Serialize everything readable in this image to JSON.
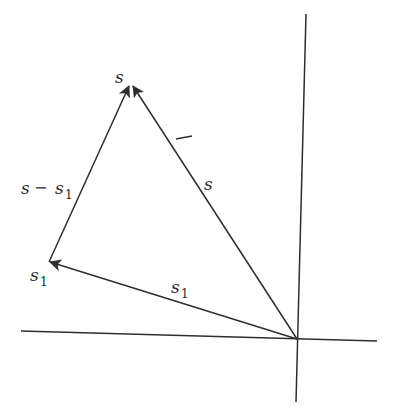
{
  "diagram": {
    "title": "",
    "labels": {
      "apex": "s",
      "vector_s": "s",
      "vector_s1": "s",
      "vector_s1_sub": "1",
      "point_s1": "s",
      "point_s1_sub": "1",
      "diff_s": "s",
      "diff_minus": "−",
      "diff_s1": "s",
      "diff_s1_sub": "1",
      "dash_mark": "—"
    },
    "colors": {
      "line": "#2e2e2e",
      "background": "#ffffff"
    }
  }
}
